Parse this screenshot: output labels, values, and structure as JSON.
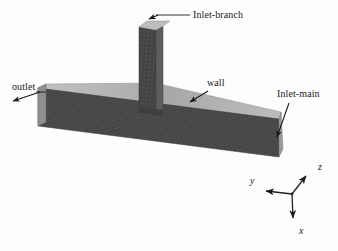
{
  "figure": {
    "background_color": "#fdfdfd",
    "width": 338,
    "height": 251
  },
  "geometry": {
    "type": "t-junction-duct",
    "main_duct": {
      "name": "main-duct",
      "front_face_color": "#4a4a4a",
      "top_face_color": "#b2b2b2",
      "end_face_color": "#9a9a9a",
      "mesh": "structured-quad"
    },
    "branch_duct": {
      "name": "branch-duct",
      "front_face_color": "#474747",
      "top_face_color": "#b2b2b2",
      "side_face_color": "#606060",
      "mesh": "structured-quad"
    }
  },
  "labels": {
    "inlet_branch": "Inlet-branch",
    "inlet_main": "Inlet-main",
    "outlet": "outlet",
    "wall": "wall"
  },
  "axes": {
    "x": "x",
    "y": "y",
    "z": "z",
    "origin_px": [
      292,
      194
    ],
    "color": "#222222"
  },
  "colors": {
    "line": "#1a1a1a",
    "text": "#1a1a1a",
    "surface_dark": "#4a4a4a",
    "surface_light": "#b2b2b2"
  }
}
